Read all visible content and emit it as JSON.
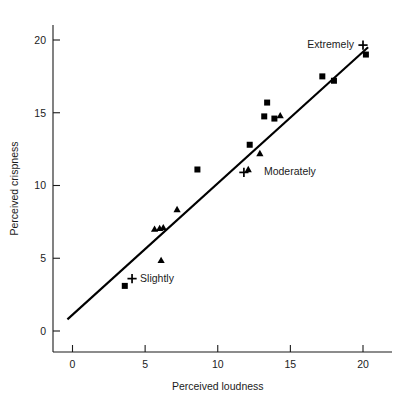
{
  "chart_data": {
    "type": "scatter",
    "title": "",
    "xlabel": "Perceived loudness",
    "ylabel": "Perceived crispness",
    "xlim": [
      -1.6,
      21.6
    ],
    "ylim": [
      -2.6,
      21.8
    ],
    "xticks": [
      0,
      5,
      10,
      15,
      20
    ],
    "xtick_labels": [
      "0",
      "5",
      "10",
      "15",
      "20"
    ],
    "yticks": [
      0,
      5,
      10,
      15,
      20
    ],
    "ytick_labels": [
      "0",
      "5",
      "10",
      "15",
      "20"
    ],
    "grid": false,
    "legend_position": "none",
    "series": [
      {
        "name": "squares",
        "marker": "square",
        "points": [
          [
            3.6,
            3.1
          ],
          [
            8.6,
            11.1
          ],
          [
            12.2,
            12.8
          ],
          [
            13.4,
            15.7
          ],
          [
            13.2,
            14.75
          ],
          [
            13.9,
            14.6
          ],
          [
            17.2,
            17.5
          ],
          [
            18.0,
            17.2
          ],
          [
            20.2,
            19.0
          ]
        ]
      },
      {
        "name": "triangles",
        "marker": "triangle",
        "points": [
          [
            6.1,
            4.85
          ],
          [
            5.65,
            7.0
          ],
          [
            6.0,
            7.05
          ],
          [
            6.25,
            7.1
          ],
          [
            7.2,
            8.35
          ],
          [
            12.1,
            11.1
          ],
          [
            12.9,
            12.2
          ],
          [
            14.3,
            14.8
          ]
        ]
      },
      {
        "name": "anchor-crosses",
        "marker": "plus",
        "points": [
          [
            4.1,
            3.6
          ],
          [
            11.8,
            10.9
          ],
          [
            20.0,
            19.65
          ]
        ]
      }
    ],
    "fit_line": {
      "name": "regression-line",
      "x_start": -0.35,
      "y_start": 0.8,
      "x_end": 20.35,
      "y_end": 19.5
    },
    "annotations": [
      {
        "text": "Slightly",
        "x": 4.1,
        "y": 3.6,
        "anchor": "left",
        "dx": 8,
        "dy": 3
      },
      {
        "text": "Moderately",
        "x": 11.8,
        "y": 10.9,
        "anchor": "left",
        "dx": 20,
        "dy": 3
      },
      {
        "text": "Extremely",
        "x": 20.0,
        "y": 19.65,
        "anchor": "right",
        "dx": -9,
        "dy": 3
      }
    ]
  }
}
